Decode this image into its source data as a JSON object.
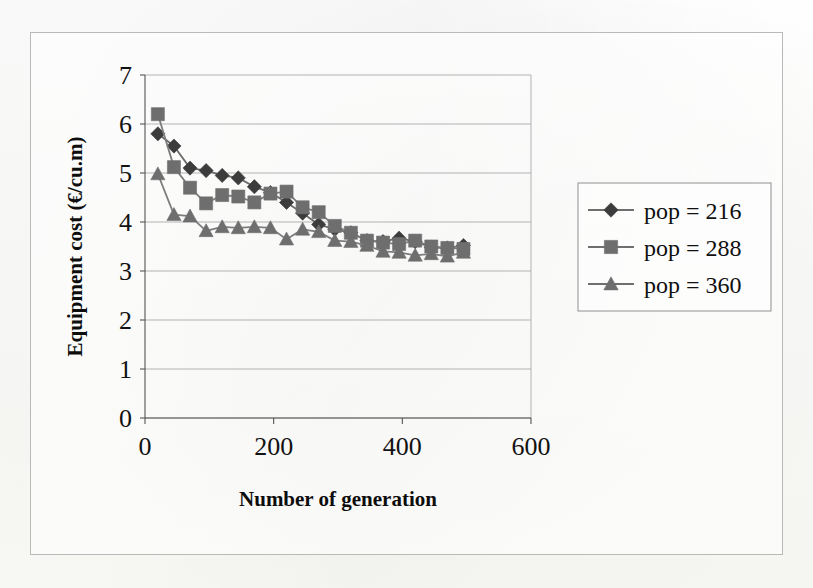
{
  "figure": {
    "frame": {
      "x": 30,
      "y": 32,
      "width": 753,
      "height": 523
    },
    "background_color": "#fdfdfb",
    "border_color": "#b9b9b9"
  },
  "chart_data": {
    "type": "line",
    "title": "",
    "subtitle": "",
    "xlabel": "Number of generation",
    "ylabel": "Equipment cost (€/cu.m)",
    "xlim": [
      0,
      600
    ],
    "ylim": [
      0,
      7
    ],
    "xticks": [
      0,
      200,
      400,
      600
    ],
    "xtick_labels": [
      "0",
      "200",
      "400",
      "600"
    ],
    "yticks": [
      0,
      1,
      2,
      3,
      4,
      5,
      6,
      7
    ],
    "ytick_labels": [
      "0",
      "1",
      "2",
      "3",
      "4",
      "5",
      "6",
      "7"
    ],
    "grid": {
      "horizontal": true,
      "vertical": false,
      "color": "#aaaaaa"
    },
    "legend": {
      "position": "right",
      "border": true
    },
    "marker_size": 9,
    "series": [
      {
        "name": "pop = 216",
        "marker": "diamond",
        "color": "#3c3c3c",
        "line_color": "#6b6b6b",
        "x": [
          20,
          45,
          70,
          95,
          120,
          145,
          170,
          195,
          220,
          245,
          270,
          295,
          320,
          345,
          370,
          395,
          420,
          445,
          470,
          495
        ],
        "y": [
          5.8,
          5.55,
          5.1,
          5.05,
          4.95,
          4.9,
          4.72,
          4.6,
          4.4,
          4.18,
          3.95,
          3.85,
          3.78,
          3.62,
          3.6,
          3.67,
          3.6,
          3.48,
          3.47,
          3.52
        ]
      },
      {
        "name": "pop = 288",
        "marker": "square",
        "color": "#6e6e6e",
        "line_color": "#7d7d7d",
        "x": [
          20,
          45,
          70,
          95,
          120,
          145,
          170,
          195,
          220,
          245,
          270,
          295,
          320,
          345,
          370,
          395,
          420,
          445,
          470,
          495
        ],
        "y": [
          6.2,
          5.12,
          4.7,
          4.38,
          4.55,
          4.52,
          4.4,
          4.58,
          4.62,
          4.3,
          4.2,
          3.92,
          3.78,
          3.62,
          3.58,
          3.55,
          3.62,
          3.5,
          3.47,
          3.45
        ]
      },
      {
        "name": "pop = 360",
        "marker": "triangle",
        "color": "#6e6e6e",
        "line_color": "#7d7d7d",
        "x": [
          20,
          45,
          70,
          95,
          120,
          145,
          170,
          195,
          220,
          245,
          270,
          295,
          320,
          345,
          370,
          395,
          420,
          445,
          470,
          495
        ],
        "y": [
          4.98,
          4.15,
          4.12,
          3.82,
          3.9,
          3.88,
          3.9,
          3.88,
          3.65,
          3.85,
          3.8,
          3.62,
          3.6,
          3.52,
          3.4,
          3.38,
          3.32,
          3.35,
          3.3,
          3.38
        ]
      }
    ]
  },
  "legend_entries": [
    {
      "label": "pop = 216",
      "marker": "diamond",
      "color": "#3c3c3c"
    },
    {
      "label": "pop = 288",
      "marker": "square",
      "color": "#6e6e6e"
    },
    {
      "label": "pop = 360",
      "marker": "triangle",
      "color": "#6e6e6e"
    }
  ]
}
